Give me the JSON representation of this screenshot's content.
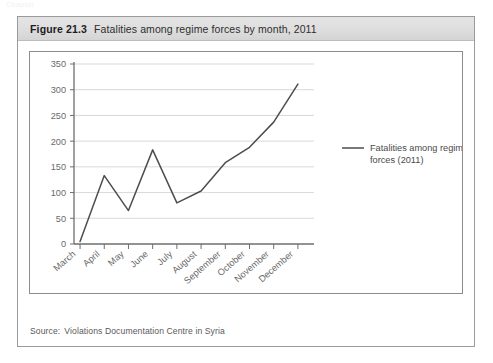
{
  "page_ghost": "Chapter",
  "figure": {
    "number": "Figure 21.3",
    "title": "Fatalities among regime forces by month, 2011",
    "source_label": "Source:",
    "source_text": "Violations Documentation Centre in Syria"
  },
  "colors": {
    "line": "#4d4d4d",
    "grid": "#d9d9d9",
    "axis": "#6e6e6e",
    "header_bg": "#dedede",
    "border": "#9a9a9a",
    "tick_text": "#6a6a6a"
  },
  "chart_data": {
    "type": "line",
    "title": "Fatalities among regime forces by month, 2011",
    "xlabel": "",
    "ylabel": "",
    "categories": [
      "March",
      "April",
      "May",
      "June",
      "July",
      "August",
      "September",
      "October",
      "November",
      "December"
    ],
    "series": [
      {
        "name": "Fatalities among regime forces (2011)",
        "values": [
          5,
          133,
          65,
          183,
          80,
          103,
          158,
          188,
          237,
          311
        ]
      }
    ],
    "ylim": [
      0,
      350
    ],
    "yticks": [
      0,
      50,
      100,
      150,
      200,
      250,
      300,
      350
    ],
    "ytick_labels": [
      "0",
      "50",
      "100",
      "150",
      "200",
      "250",
      "300",
      "350"
    ],
    "grid": true,
    "legend_position": "right",
    "legend": [
      {
        "label_line1": "Fatalities among regime",
        "label_line2": "forces (2011)"
      }
    ]
  }
}
